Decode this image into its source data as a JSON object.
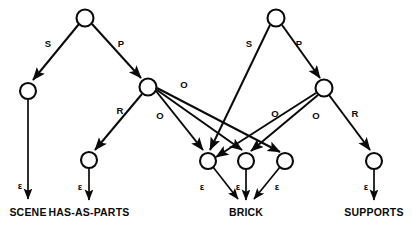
{
  "diagram": {
    "type": "parse-tree-graph",
    "background_color": "#ffffff",
    "stroke_color": "#0a0a0a",
    "nodes": [
      {
        "id": "n_root_left",
        "cx": 85,
        "cy": 18,
        "r": 8.5
      },
      {
        "id": "n_root_right",
        "cx": 276,
        "cy": 18,
        "r": 8.5
      },
      {
        "id": "n_scene",
        "cx": 28,
        "cy": 91,
        "r": 8.0
      },
      {
        "id": "n_mid_left",
        "cx": 148,
        "cy": 87,
        "r": 8.5
      },
      {
        "id": "n_mid_right",
        "cx": 324,
        "cy": 88,
        "r": 8.5
      },
      {
        "id": "n_hasasparts",
        "cx": 89,
        "cy": 160,
        "r": 8.0
      },
      {
        "id": "n_brick_1",
        "cx": 208,
        "cy": 161,
        "r": 8.0
      },
      {
        "id": "n_brick_2",
        "cx": 246,
        "cy": 161,
        "r": 8.0
      },
      {
        "id": "n_brick_3",
        "cx": 285,
        "cy": 161,
        "r": 8.0
      },
      {
        "id": "n_supports",
        "cx": 374,
        "cy": 161,
        "r": 8.0
      }
    ],
    "edges": [
      {
        "id": "e_s_left",
        "from": "n_root_left",
        "to": "n_scene",
        "label": "S"
      },
      {
        "id": "e_p_left",
        "from": "n_root_left",
        "to": "n_mid_left",
        "label": "P"
      },
      {
        "id": "e_r_left",
        "from": "n_mid_left",
        "to": "n_hasasparts",
        "label": "R"
      },
      {
        "id": "e_o_l1",
        "from": "n_mid_left",
        "to": "n_brick_1",
        "label": "O"
      },
      {
        "id": "e_o_l2",
        "from": "n_mid_left",
        "to": "n_brick_2",
        "label": "O"
      },
      {
        "id": "e_o_l3",
        "from": "n_mid_left",
        "to": "n_brick_3",
        "label": ""
      },
      {
        "id": "e_s_right",
        "from": "n_root_right",
        "to": "n_brick_1",
        "label": "S"
      },
      {
        "id": "e_p_right",
        "from": "n_root_right",
        "to": "n_mid_right",
        "label": "P"
      },
      {
        "id": "e_o_r1",
        "from": "n_mid_right",
        "to": "n_brick_1",
        "label": "O"
      },
      {
        "id": "e_o_r2",
        "from": "n_mid_right",
        "to": "n_brick_2",
        "label": "O"
      },
      {
        "id": "e_r_right",
        "from": "n_mid_right",
        "to": "n_supports",
        "label": "R"
      }
    ],
    "edge_labels": [
      {
        "id": "lbl_s_left",
        "text": "S",
        "x": 48,
        "y": 47
      },
      {
        "id": "lbl_p_left",
        "text": "P",
        "x": 121,
        "y": 47
      },
      {
        "id": "lbl_r_left",
        "text": "R",
        "x": 120,
        "y": 114
      },
      {
        "id": "lbl_o_1",
        "text": "O",
        "x": 184,
        "y": 88
      },
      {
        "id": "lbl_o_2",
        "text": "O",
        "x": 160,
        "y": 119
      },
      {
        "id": "lbl_s_right",
        "text": "S",
        "x": 249,
        "y": 47
      },
      {
        "id": "lbl_p_right",
        "text": "P",
        "x": 299,
        "y": 47
      },
      {
        "id": "lbl_o_3",
        "text": "O",
        "x": 275,
        "y": 117
      },
      {
        "id": "lbl_o_4",
        "text": "O",
        "x": 316,
        "y": 119
      },
      {
        "id": "lbl_r_right",
        "text": "R",
        "x": 355,
        "y": 117
      }
    ],
    "epsilon_symbol": "ε",
    "terminals": [
      {
        "id": "t_scene",
        "text": "SCENE",
        "x": 28,
        "y": 215,
        "eps_x": 20,
        "eps_y": 186,
        "node": "n_scene"
      },
      {
        "id": "t_hasasparts",
        "text": "HAS-AS-PARTS",
        "x": 89,
        "y": 215,
        "eps_x": 80,
        "eps_y": 188,
        "node": "n_hasasparts"
      },
      {
        "id": "t_brick",
        "text": "BRICK",
        "x": 246,
        "y": 215,
        "eps_x": 0,
        "eps_y": 0,
        "node": "n_brick_2"
      },
      {
        "id": "t_supports",
        "text": "SUPPORTS",
        "x": 374,
        "y": 215,
        "eps_x": 366,
        "eps_y": 188,
        "node": "n_supports"
      }
    ],
    "brick_epsilons": [
      {
        "id": "eps_brick_1",
        "x": 200,
        "y": 188
      },
      {
        "id": "eps_brick_2",
        "x": 238,
        "y": 188
      },
      {
        "id": "eps_brick_3",
        "x": 277,
        "y": 188
      }
    ]
  }
}
